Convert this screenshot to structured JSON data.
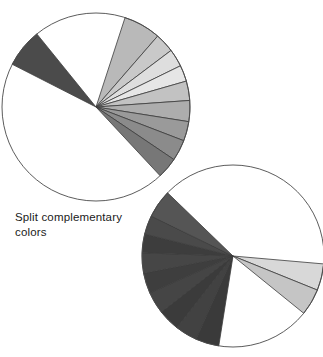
{
  "figure": {
    "caption": "Split complementary\ncolors",
    "background": "#ffffff",
    "outline_color": "#4a4a4a",
    "stroke_color": "#3c3c3c"
  },
  "chart_data": [
    {
      "type": "pie",
      "name": "top-wheel",
      "title": "Split complementary colors (wheel 1)",
      "center": [
        96,
        107
      ],
      "radius": 94,
      "rotation_note": "angles measured in degrees clockwise from 12 o'clock",
      "categories": [
        "gap-upper-left",
        "dark-wedge",
        "gap-upper",
        "light-1",
        "light-2",
        "light-3",
        "light-4",
        "light-5",
        "mid-1",
        "mid-2",
        "mid-3",
        "mid-4",
        "gap-lower-left"
      ],
      "values": [
        14,
        24,
        57,
        23,
        12,
        11,
        10,
        12,
        13,
        12,
        13,
        13,
        146
      ],
      "slices": [
        {
          "label": "gap-upper-left",
          "start": 283,
          "end": 297,
          "color": "#ffffff",
          "filled": false
        },
        {
          "label": "dark-wedge",
          "start": 297,
          "end": 321,
          "color": "#4b4b4b",
          "filled": true
        },
        {
          "label": "gap-upper",
          "start": 321,
          "end": 378,
          "color": "#ffffff",
          "filled": false
        },
        {
          "label": "light-1",
          "start": 18,
          "end": 41,
          "color": "#b9b9b9",
          "filled": true
        },
        {
          "label": "light-2",
          "start": 41,
          "end": 53,
          "color": "#c9c9c9",
          "filled": true
        },
        {
          "label": "light-3",
          "start": 53,
          "end": 64,
          "color": "#dedede",
          "filled": true
        },
        {
          "label": "light-4",
          "start": 64,
          "end": 74,
          "color": "#e6e6e6",
          "filled": true
        },
        {
          "label": "light-5",
          "start": 74,
          "end": 86,
          "color": "#c2c2c2",
          "filled": true
        },
        {
          "label": "mid-1",
          "start": 86,
          "end": 99,
          "color": "#adadad",
          "filled": true
        },
        {
          "label": "mid-2",
          "start": 99,
          "end": 111,
          "color": "#9a9a9a",
          "filled": true
        },
        {
          "label": "mid-3",
          "start": 111,
          "end": 124,
          "color": "#8b8b8b",
          "filled": true
        },
        {
          "label": "mid-4",
          "start": 124,
          "end": 137,
          "color": "#777777",
          "filled": true
        },
        {
          "label": "gap-lower-left",
          "start": 137,
          "end": 283,
          "color": "#ffffff",
          "filled": false
        }
      ],
      "ylabel": "",
      "xlabel": "",
      "legend": "none",
      "grid": false
    },
    {
      "type": "pie",
      "name": "bottom-wheel",
      "title": "Split complementary colors (wheel 2)",
      "center": [
        233,
        256
      ],
      "radius": 91,
      "rotation_note": "angles measured in degrees clockwise from 12 o'clock",
      "categories": [
        "gap-right",
        "light-a",
        "light-b",
        "gap-lower",
        "dark-1",
        "dark-2",
        "dark-3",
        "dark-4",
        "dark-5",
        "dark-6",
        "dark-7",
        "dark-8",
        "dark-9",
        "gap-top"
      ],
      "values": [
        95,
        17,
        17,
        60,
        15,
        14,
        14,
        14,
        13,
        13,
        12,
        12,
        18,
        46
      ],
      "slices": [
        {
          "label": "gap-right",
          "start": 0,
          "end": 95,
          "color": "#ffffff",
          "filled": false
        },
        {
          "label": "light-a",
          "start": 95,
          "end": 112,
          "color": "#d8d8d8",
          "filled": true
        },
        {
          "label": "light-b",
          "start": 112,
          "end": 129,
          "color": "#c5c5c5",
          "filled": true
        },
        {
          "label": "gap-lower",
          "start": 129,
          "end": 189,
          "color": "#ffffff",
          "filled": false
        },
        {
          "label": "dark-1",
          "start": 189,
          "end": 204,
          "color": "#3a3a3a",
          "filled": true
        },
        {
          "label": "dark-2",
          "start": 204,
          "end": 218,
          "color": "#424242",
          "filled": true
        },
        {
          "label": "dark-3",
          "start": 218,
          "end": 232,
          "color": "#3b3b3b",
          "filled": true
        },
        {
          "label": "dark-4",
          "start": 232,
          "end": 246,
          "color": "#454545",
          "filled": true
        },
        {
          "label": "dark-5",
          "start": 246,
          "end": 259,
          "color": "#3e3e3e",
          "filled": true
        },
        {
          "label": "dark-6",
          "start": 259,
          "end": 272,
          "color": "#464646",
          "filled": true
        },
        {
          "label": "dark-7",
          "start": 272,
          "end": 284,
          "color": "#3d3d3d",
          "filled": true
        },
        {
          "label": "dark-8",
          "start": 284,
          "end": 296,
          "color": "#4a4a4a",
          "filled": true
        },
        {
          "label": "dark-9",
          "start": 296,
          "end": 314,
          "color": "#555555",
          "filled": true
        },
        {
          "label": "gap-top",
          "start": 314,
          "end": 360,
          "color": "#ffffff",
          "filled": false
        }
      ],
      "ylabel": "",
      "xlabel": "",
      "legend": "none",
      "grid": false
    }
  ]
}
